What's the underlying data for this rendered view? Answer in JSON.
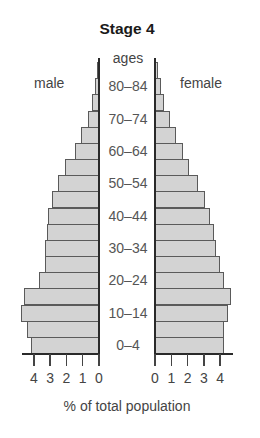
{
  "chart_data": {
    "type": "bar",
    "subtype": "population-pyramid",
    "title": "Stage 4",
    "category_axis_label": "ages",
    "xlabel": "% of total population",
    "ylabel": "ages",
    "series": [
      {
        "name": "male",
        "side": "left",
        "values": [
          4.2,
          4.4,
          4.8,
          4.6,
          3.7,
          3.3,
          3.3,
          3.2,
          3.1,
          2.9,
          2.5,
          2.1,
          1.5,
          1.1,
          0.7,
          0.4,
          0.25,
          0.1
        ]
      },
      {
        "name": "female",
        "side": "right",
        "values": [
          4.2,
          4.2,
          4.4,
          4.6,
          4.2,
          3.9,
          3.7,
          3.55,
          3.3,
          3.0,
          2.6,
          2.0,
          1.65,
          1.2,
          0.85,
          0.5,
          0.3,
          0.15
        ]
      }
    ],
    "categories": [
      "0–4",
      "5–9",
      "10–14",
      "15–19",
      "20–24",
      "25–29",
      "30–34",
      "35–39",
      "40–44",
      "45–49",
      "50–54",
      "55–59",
      "60–64",
      "65–69",
      "70–74",
      "75–79",
      "80–84",
      "85+"
    ],
    "labeled_categories": [
      "80–84",
      "70–74",
      "60–64",
      "50–54",
      "40–44",
      "30–34",
      "20–24",
      "10–14",
      "0–4"
    ],
    "xlim": [
      0,
      4
    ],
    "male_ticks": [
      "4",
      "3",
      "2",
      "1",
      "0"
    ],
    "female_ticks": [
      "0",
      "1",
      "2",
      "3",
      "4"
    ],
    "grid": false,
    "legend": "side labels (male left, female right)",
    "colors": {
      "bar_fill": "#d3d3d3",
      "bar_edge": "#5a5a5a",
      "axis": "#2a2a2a"
    }
  },
  "labels": {
    "title": "Stage 4",
    "ages": "ages",
    "male": "male",
    "female": "female",
    "xlabel": "% of total population"
  }
}
